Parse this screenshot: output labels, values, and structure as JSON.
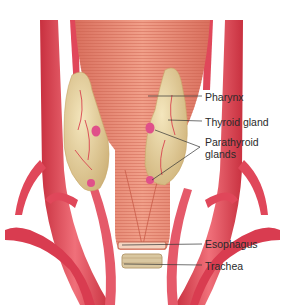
{
  "diagram": {
    "labels": [
      {
        "id": "pharynx",
        "text": "Pharynx",
        "x": 205,
        "y": 91
      },
      {
        "id": "thyroid",
        "text": "Thyroid gland",
        "x": 205,
        "y": 116
      },
      {
        "id": "parathyroid_1",
        "text": "Parathyroid",
        "x": 205,
        "y": 136
      },
      {
        "id": "parathyroid_2",
        "text": "glands",
        "x": 205,
        "y": 148
      },
      {
        "id": "esophagus",
        "text": "Esophagus",
        "x": 205,
        "y": 238
      },
      {
        "id": "trachea",
        "text": "Trachea",
        "x": 205,
        "y": 260
      }
    ],
    "colors": {
      "artery": "#e0475a",
      "artery_highlight": "#f28a93",
      "muscle": "#e8826d",
      "muscle_stripe": "#d2634f",
      "gland": "#e9d7a2",
      "gland_shadow": "#cdb47a",
      "parathyroid": "#e0508a",
      "trachea": "#d9c7a0",
      "leader_line": "#333333",
      "text": "#2a2a2a"
    }
  }
}
